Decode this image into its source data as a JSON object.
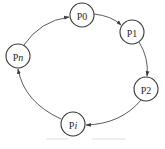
{
  "diagram": {
    "type": "cycle",
    "direction": "clockwise",
    "nodes": [
      {
        "id": "P0",
        "prefix": "P",
        "suffix": "0",
        "suffix_italic": false,
        "cx": 82,
        "cy": 15
      },
      {
        "id": "P1",
        "prefix": "P",
        "suffix": "1",
        "suffix_italic": false,
        "cx": 132,
        "cy": 32
      },
      {
        "id": "P2",
        "prefix": "P",
        "suffix": "2",
        "suffix_italic": false,
        "cx": 146,
        "cy": 89
      },
      {
        "id": "Pi",
        "prefix": "P",
        "suffix": "i",
        "suffix_italic": true,
        "cx": 73,
        "cy": 124
      },
      {
        "id": "Pn",
        "prefix": "P",
        "suffix": "n",
        "suffix_italic": true,
        "cx": 18,
        "cy": 56
      }
    ],
    "edges": [
      {
        "from": "P0",
        "to": "P1"
      },
      {
        "from": "P1",
        "to": "P2"
      },
      {
        "from": "P2",
        "to": "Pi"
      },
      {
        "from": "Pi",
        "to": "Pn"
      },
      {
        "from": "Pn",
        "to": "P0"
      }
    ],
    "colors": {
      "stroke": "#3a3a3a",
      "text": "#2a2a2a",
      "background": "#ffffff"
    }
  }
}
